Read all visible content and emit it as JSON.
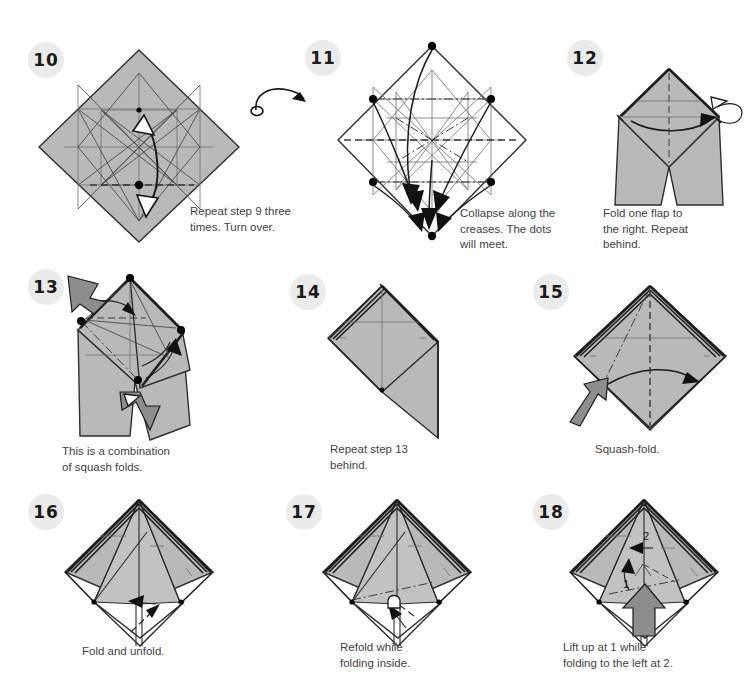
{
  "document": {
    "type": "origami-instruction-diagram",
    "background_color": "#ffffff",
    "paper_color": "#b9b9b9",
    "badge_color": "#ebebeb",
    "text_color": "#3f3f3f"
  },
  "steps": [
    {
      "number": "10",
      "caption": "Repeat step 9 three\ntimes. Turn over.",
      "figure": "precreased-diamond-grid",
      "notes": "Gray diamond with full crease grid, center dot, valley line across middle, long curved arrow"
    },
    {
      "number": "11",
      "caption": "Collapse along the\ncreases. The dots\nwill meet.",
      "figure": "white-diamond-collapse",
      "notes": "White diamond with dense creases, six black dots, multiple curved arrows converging to bottom point"
    },
    {
      "number": "12",
      "caption": "Fold one flap to\nthe right. Repeat\nbehind.",
      "figure": "diamond-with-legs",
      "notes": "Gray diamond above crossed legs, horizontal curved arrow right, repeat-behind loop arrow"
    },
    {
      "number": "13",
      "caption": "This is a combination\nof squash folds.",
      "figure": "squash-combination",
      "notes": "Tilted gray form with two push arrows, dots, dashed and dash-dot creases"
    },
    {
      "number": "14",
      "caption": "Repeat step 13\nbehind.",
      "figure": "diamond-with-flap",
      "notes": "Gray diamond with layered left edge and a triangular flap pointing down-right"
    },
    {
      "number": "15",
      "caption": "Squash-fold.",
      "figure": "layered-diamond-squash",
      "notes": "Gray layered diamond, push arrow from lower-left, curved arrow to the right, mountain centerline"
    },
    {
      "number": "16",
      "caption": "Fold and unfold.",
      "figure": "kite-diamond-foldunfold",
      "notes": "Layered gray diamond with inner triangle panels and small fold-and-unfold arrow at bottom"
    },
    {
      "number": "17",
      "caption": "Refold while\nfolding inside.",
      "figure": "kite-diamond-refold",
      "notes": "Same shape as 16 with dash-dot crease and small arrow pointing up-left at the bottom stem"
    },
    {
      "number": "18",
      "caption": "Lift up at 1 while\nfolding to the left at 2.",
      "figure": "kite-diamond-lift",
      "notes": "Same shape with numbered labels 1 and 2, two thin arrows and a large push arrow from below",
      "labels": [
        "1",
        "2"
      ]
    }
  ]
}
